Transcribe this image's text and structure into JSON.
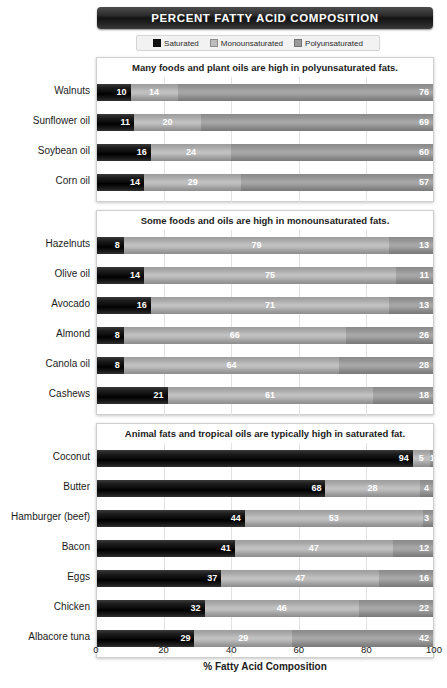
{
  "header": {
    "title": "PERCENT FATTY ACID COMPOSITION"
  },
  "legend": {
    "items": [
      {
        "label": "Saturated",
        "color": "#111111",
        "icon": "square-swatch-icon"
      },
      {
        "label": "Monounsaturated",
        "color": "#bdbdbd",
        "icon": "square-swatch-icon"
      },
      {
        "label": "Polyunsaturated",
        "color": "#9b9b9b",
        "icon": "square-swatch-icon"
      }
    ]
  },
  "axis": {
    "ticks": [
      "0",
      "20",
      "40",
      "60",
      "80",
      "100"
    ],
    "title": "% Fatty Acid Composition"
  },
  "panels": [
    {
      "title": "Many foods and plant oils are high in polyunsaturated fats."
    },
    {
      "title": "Some foods and oils are high in monounsaturated fats."
    },
    {
      "title": "Animal fats and tropical oils are typically high in saturated fat."
    }
  ],
  "chart_data": {
    "type": "bar",
    "title": "PERCENT FATTY ACID COMPOSITION",
    "xlabel": "% Fatty Acid Composition",
    "ylabel": "",
    "xlim": [
      0,
      100
    ],
    "xticks": [
      0,
      20,
      40,
      60,
      80,
      100
    ],
    "orientation": "horizontal",
    "stacked": true,
    "grid": "vertical",
    "legend_position": "top",
    "series": [
      {
        "name": "Saturated",
        "color": "#111111"
      },
      {
        "name": "Monounsaturated",
        "color": "#bdbdbd"
      },
      {
        "name": "Polyunsaturated",
        "color": "#9b9b9b"
      }
    ],
    "groups": [
      {
        "title": "Many foods and plant oils are high in polyunsaturated fats.",
        "categories": [
          "Walnuts",
          "Sunflower oil",
          "Soybean oil",
          "Corn oil"
        ],
        "values": [
          {
            "category": "Walnuts",
            "saturated": 10,
            "monounsaturated": 14,
            "polyunsaturated": 76
          },
          {
            "category": "Sunflower oil",
            "saturated": 11,
            "monounsaturated": 20,
            "polyunsaturated": 69
          },
          {
            "category": "Soybean oil",
            "saturated": 16,
            "monounsaturated": 24,
            "polyunsaturated": 60
          },
          {
            "category": "Corn oil",
            "saturated": 14,
            "monounsaturated": 29,
            "polyunsaturated": 57
          }
        ]
      },
      {
        "title": "Some foods and oils are high in monounsaturated fats.",
        "categories": [
          "Hazelnuts",
          "Olive oil",
          "Avocado",
          "Almond",
          "Canola oil",
          "Cashews"
        ],
        "values": [
          {
            "category": "Hazelnuts",
            "saturated": 8,
            "monounsaturated": 79,
            "polyunsaturated": 13
          },
          {
            "category": "Olive oil",
            "saturated": 14,
            "monounsaturated": 75,
            "polyunsaturated": 11
          },
          {
            "category": "Avocado",
            "saturated": 16,
            "monounsaturated": 71,
            "polyunsaturated": 13
          },
          {
            "category": "Almond",
            "saturated": 8,
            "monounsaturated": 66,
            "polyunsaturated": 26
          },
          {
            "category": "Canola oil",
            "saturated": 8,
            "monounsaturated": 64,
            "polyunsaturated": 28
          },
          {
            "category": "Cashews",
            "saturated": 21,
            "monounsaturated": 61,
            "polyunsaturated": 18
          }
        ]
      },
      {
        "title": "Animal fats and tropical oils are typically high in saturated fat.",
        "categories": [
          "Coconut",
          "Butter",
          "Hamburger (beef)",
          "Bacon",
          "Eggs",
          "Chicken",
          "Albacore tuna"
        ],
        "values": [
          {
            "category": "Coconut",
            "saturated": 94,
            "monounsaturated": 5,
            "polyunsaturated": 1
          },
          {
            "category": "Butter",
            "saturated": 68,
            "monounsaturated": 28,
            "polyunsaturated": 4
          },
          {
            "category": "Hamburger (beef)",
            "saturated": 44,
            "monounsaturated": 53,
            "polyunsaturated": 3
          },
          {
            "category": "Bacon",
            "saturated": 41,
            "monounsaturated": 47,
            "polyunsaturated": 12
          },
          {
            "category": "Eggs",
            "saturated": 37,
            "monounsaturated": 47,
            "polyunsaturated": 16
          },
          {
            "category": "Chicken",
            "saturated": 32,
            "monounsaturated": 46,
            "polyunsaturated": 22
          },
          {
            "category": "Albacore tuna",
            "saturated": 29,
            "monounsaturated": 29,
            "polyunsaturated": 42
          }
        ]
      }
    ]
  }
}
